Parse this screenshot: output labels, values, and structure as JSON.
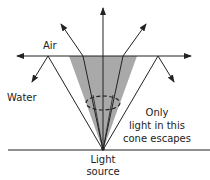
{
  "diagram": {
    "labels": {
      "air": "Air",
      "water": "Water",
      "cone_note_line1": "Only",
      "cone_note_line2": "light in this",
      "cone_note_line3": "cone escapes",
      "source_line1": "Light",
      "source_line2": "source"
    },
    "colors": {
      "cone_fill": "#a9a9a9",
      "line": "#222222",
      "background": "#ffffff"
    }
  }
}
